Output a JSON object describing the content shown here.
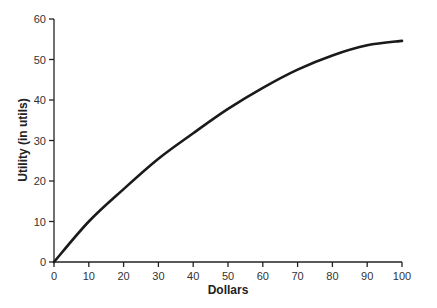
{
  "chart_data": {
    "type": "line",
    "title": "",
    "xlabel": "Dollars",
    "ylabel": "Utility (in utils)",
    "xlim": [
      0,
      100
    ],
    "ylim": [
      0,
      60
    ],
    "grid": false,
    "legend": null,
    "x_ticks": [
      0,
      10,
      20,
      30,
      40,
      50,
      60,
      70,
      80,
      90,
      100
    ],
    "y_ticks": [
      0,
      10,
      20,
      30,
      40,
      50,
      60
    ],
    "series": [
      {
        "name": "Utility",
        "color": "#1a1a1a",
        "x": [
          0,
          10,
          20,
          30,
          40,
          50,
          60,
          70,
          80,
          90,
          100
        ],
        "y": [
          0,
          10,
          18,
          25.5,
          31.8,
          37.8,
          43,
          47.5,
          51,
          53.5,
          54.6
        ]
      }
    ]
  }
}
